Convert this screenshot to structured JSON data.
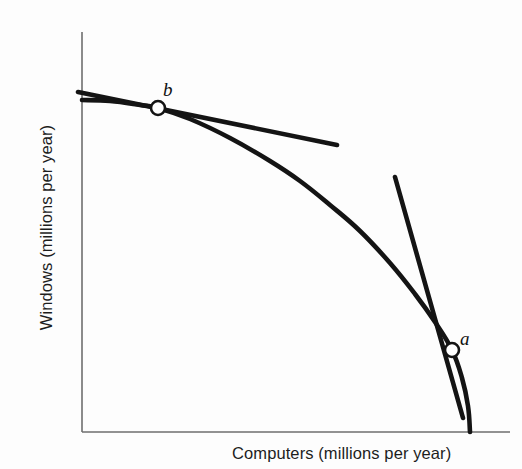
{
  "chart_data": {
    "type": "line",
    "title": "",
    "subtitle": "",
    "xlabel": "Computers (millions per year)",
    "ylabel": "Windows (millions per year)",
    "xlim": [
      0,
      100
    ],
    "ylim": [
      0,
      100
    ],
    "grid": false,
    "legend": null,
    "axis_ticks": {
      "x": [],
      "y": []
    },
    "series": [
      {
        "name": "production-possibilities-frontier",
        "kind": "curve",
        "stroke": "#141414",
        "stroke_width": 4.6,
        "points_px": [
          [
            82,
            100
          ],
          [
            110,
            101
          ],
          [
            140,
            105
          ],
          [
            158,
            108
          ],
          [
            190,
            119
          ],
          [
            230,
            138
          ],
          [
            270,
            161
          ],
          [
            300,
            181
          ],
          [
            330,
            205
          ],
          [
            360,
            231
          ],
          [
            390,
            263
          ],
          [
            415,
            294
          ],
          [
            435,
            322
          ],
          [
            452,
            350
          ],
          [
            462,
            378
          ],
          [
            468,
            406
          ],
          [
            470,
            432
          ]
        ]
      },
      {
        "name": "tangent-at-b",
        "kind": "line",
        "stroke": "#141414",
        "stroke_width": 4.6,
        "points_px": [
          [
            78,
            92
          ],
          [
            337,
            145
          ]
        ]
      },
      {
        "name": "tangent-at-a",
        "kind": "line",
        "stroke": "#141414",
        "stroke_width": 4.6,
        "points_px": [
          [
            395,
            177
          ],
          [
            463,
            418
          ]
        ]
      }
    ],
    "annotations": [
      {
        "name": "point-b",
        "label": "b",
        "marker": "open-circle",
        "x_px": 158,
        "y_px": 108,
        "radius_px": 7,
        "fill": "#ffffff",
        "stroke": "#141414",
        "label_x_px": 163,
        "label_y_px": 79
      },
      {
        "name": "point-a",
        "label": "a",
        "marker": "open-circle",
        "x_px": 452,
        "y_px": 350,
        "radius_px": 7,
        "fill": "#ffffff",
        "stroke": "#141414",
        "label_x_px": 460,
        "label_y_px": 328
      }
    ],
    "axes_px": {
      "y_axis": [
        [
          82,
          32
        ],
        [
          82,
          432
        ]
      ],
      "x_axis": [
        [
          82,
          432
        ],
        [
          510,
          432
        ]
      ],
      "stroke": "#6e6e6e",
      "stroke_width": 1.6
    }
  },
  "colors": {
    "background": "#fdfdfd",
    "curve": "#141414",
    "axis": "#6e6e6e",
    "text": "#1d1d1d",
    "marker_fill": "#ffffff"
  }
}
